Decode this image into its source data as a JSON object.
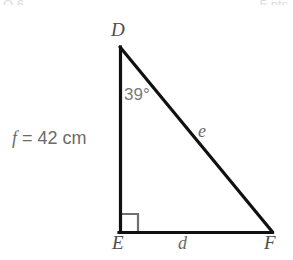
{
  "figure": {
    "background_color": "#ffffff",
    "stroke_color": "#111111",
    "label_color": "#6a6a6a",
    "right_angle_color": "#6f6f6f",
    "vertices": {
      "D": {
        "label": "D",
        "x": 120,
        "y": 47
      },
      "E": {
        "label": "E",
        "x": 120,
        "y": 232
      },
      "F": {
        "label": "F",
        "x": 272,
        "y": 232
      }
    },
    "sides": {
      "e": {
        "label": "e",
        "between": "D-F",
        "note": "hypotenuse"
      },
      "d": {
        "label": "d",
        "between": "E-F",
        "note": "base"
      },
      "f": {
        "label": "f",
        "between": "D-E",
        "note": "vertical leg"
      }
    },
    "angle_at_D": {
      "value": "39",
      "unit": "°",
      "label": "39°"
    },
    "right_angle_at": "E",
    "measurement": {
      "variable": "f",
      "equals": "=",
      "value": "42",
      "unit": "cm",
      "full": "f = 42 cm"
    },
    "edge_fragments": {
      "left": "Q 6.",
      "right": "5 pts"
    }
  }
}
